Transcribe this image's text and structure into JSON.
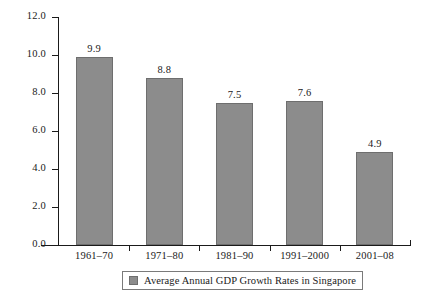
{
  "chart_data": {
    "type": "bar",
    "title": "",
    "subtitle": "",
    "xlabel": "",
    "ylabel": "",
    "categories": [
      "1961–70",
      "1971–80",
      "1981–90",
      "1991–2000",
      "2001–08"
    ],
    "values": [
      9.9,
      8.8,
      7.5,
      7.6,
      4.9
    ],
    "value_labels": [
      "9.9",
      "8.8",
      "7.5",
      "7.6",
      "4.9"
    ],
    "series": [
      {
        "name": "Average Annual GDP Growth Rates in Singapore",
        "values": [
          9.9,
          8.8,
          7.5,
          7.6,
          4.9
        ],
        "color": "#8c8c8c"
      }
    ],
    "ylim": [
      0.0,
      12.0
    ],
    "ytick_labels": [
      "0.0",
      "2.0",
      "4.0",
      "6.0",
      "8.0",
      "10.0",
      "12.0"
    ],
    "ytick_values": [
      0.0,
      2.0,
      4.0,
      6.0,
      8.0,
      10.0,
      12.0
    ],
    "grid": false,
    "legend_position": "bottom",
    "legend_entries": [
      "Average Annual GDP Growth Rates in Singapore"
    ],
    "bar_color": "#8c8c8c",
    "bar_border_color": "#6e6e6e",
    "axis_color": "#1a1a1a",
    "background_color": "#ffffff"
  },
  "legend": {
    "label": "Average Annual GDP Growth Rates in Singapore"
  }
}
